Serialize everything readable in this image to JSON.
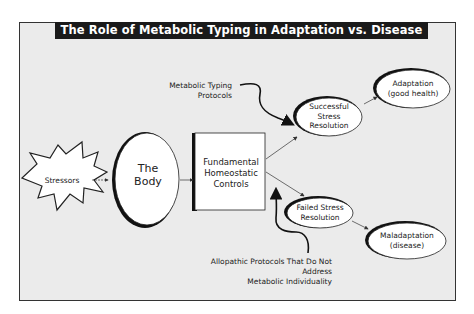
{
  "title": "The Role of Metabolic Typing in Adaptation vs. Disease",
  "nodes": {
    "stressors": "Stressors",
    "body": [
      "The",
      "Body"
    ],
    "controls": [
      "Fundamental",
      "Homeostatic",
      "Controls"
    ],
    "successful": [
      "Successful",
      "Stress",
      "Resolution"
    ],
    "failed": [
      "Failed Stress",
      "Resolution"
    ],
    "adaptation": [
      "Adaptation",
      "(good health)"
    ],
    "maladaptation": [
      "Maladaptation",
      "(disease)"
    ]
  },
  "annotations": {
    "metabolic_typing": [
      "Metabolic Typing",
      "Protocols"
    ],
    "allopathic": [
      "Allopathic Protocols That Do Not Address",
      "Metabolic Individuality"
    ]
  },
  "edges": [
    {
      "from": "stressors",
      "to": "body"
    },
    {
      "from": "body",
      "to": "controls"
    },
    {
      "from": "controls",
      "to": "successful"
    },
    {
      "from": "controls",
      "to": "failed"
    },
    {
      "from": "successful",
      "to": "adaptation"
    },
    {
      "from": "failed",
      "to": "maladaptation"
    },
    {
      "from": "metabolic_typing",
      "to": "successful"
    },
    {
      "from": "allopathic",
      "to": "controls"
    }
  ],
  "colors": {
    "background": "#ebebeb",
    "title_bar": "#1a1a1a",
    "shape_fill": "#ffffff",
    "stroke": "#1a1a1a"
  }
}
